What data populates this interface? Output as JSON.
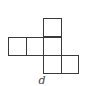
{
  "diagram": {
    "type": "cube-net",
    "label": "d",
    "cell_size_px": 18,
    "line_color": "#3a3a3a",
    "cells": [
      {
        "row": 0,
        "col": 2,
        "x": 43,
        "y": 18
      },
      {
        "row": 1,
        "col": 0,
        "x": 8,
        "y": 37
      },
      {
        "row": 1,
        "col": 1,
        "x": 26,
        "y": 37
      },
      {
        "row": 1,
        "col": 2,
        "x": 43,
        "y": 37
      },
      {
        "row": 2,
        "col": 2,
        "x": 43,
        "y": 55
      },
      {
        "row": 2,
        "col": 3,
        "x": 61,
        "y": 55
      }
    ]
  }
}
